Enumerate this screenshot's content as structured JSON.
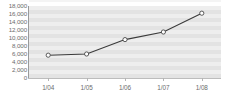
{
  "chart_data": {
    "type": "line",
    "title": "",
    "xlabel": "",
    "ylabel": "",
    "categories": [
      "1/04",
      "1/05",
      "1/06",
      "1/07",
      "1/08"
    ],
    "values": [
      5700,
      6000,
      9600,
      11500,
      16200
    ],
    "series": [
      {
        "name": "series-1",
        "values": [
          5700,
          6000,
          9600,
          11500,
          16200
        ]
      }
    ],
    "ylim": [
      0,
      18000
    ],
    "ytick_step": 2000,
    "ytick_labels": [
      "0",
      "2,000",
      "4,000",
      "6,000",
      "8,000",
      "10,000",
      "12,000",
      "14,000",
      "16,000",
      "18,000"
    ],
    "ytick_values": [
      0,
      2000,
      4000,
      6000,
      8000,
      10000,
      12000,
      14000,
      16000,
      18000
    ],
    "grid": true,
    "legend": false,
    "legend_position": "none",
    "colors": {
      "plot_background": "#e3e3e3",
      "grid_band": "#eeeeee",
      "line": "#3a3a3a",
      "marker_fill": "#ffffff",
      "marker_stroke": "#4a4a4a",
      "axis": "#9a9a9a",
      "tick_text": "#6d6d6d",
      "page_background": "#ffffff"
    },
    "marker": "circle"
  }
}
